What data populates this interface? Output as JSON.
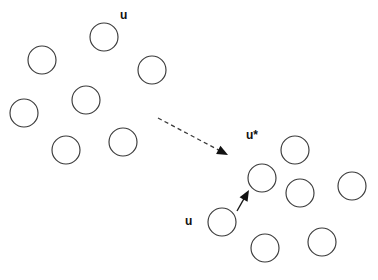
{
  "figure": {
    "width": 378,
    "height": 280,
    "background_color": "#ffffff",
    "circle_stroke_color": "#3a3a3a",
    "arrow_color": "#111111",
    "label_color": "#111111"
  },
  "labels": [
    {
      "id": "label-u-top",
      "text": "u",
      "x": 120,
      "y": 9
    },
    {
      "id": "label-u-star",
      "text": "u*",
      "x": 246,
      "y": 129
    },
    {
      "id": "label-u-bottom",
      "text": "u",
      "x": 185,
      "y": 215
    }
  ],
  "clusters": [
    {
      "name": "left-cluster",
      "circles": [
        {
          "id": "circle-left-1",
          "cx": 104,
          "cy": 37,
          "r": 14
        },
        {
          "id": "circle-left-2",
          "cx": 42,
          "cy": 60,
          "r": 14
        },
        {
          "id": "circle-left-3",
          "cx": 152,
          "cy": 70,
          "r": 14
        },
        {
          "id": "circle-left-4",
          "cx": 86,
          "cy": 100,
          "r": 14
        },
        {
          "id": "circle-left-5",
          "cx": 24,
          "cy": 113,
          "r": 14
        },
        {
          "id": "circle-left-6",
          "cx": 66,
          "cy": 150,
          "r": 14
        },
        {
          "id": "circle-left-7",
          "cx": 123,
          "cy": 142,
          "r": 14
        }
      ]
    },
    {
      "name": "right-cluster",
      "circles": [
        {
          "id": "circle-u-star",
          "cx": 262,
          "cy": 178,
          "r": 14
        },
        {
          "id": "circle-right-2",
          "cx": 295,
          "cy": 150,
          "r": 14
        },
        {
          "id": "circle-right-3",
          "cx": 300,
          "cy": 193,
          "r": 14
        },
        {
          "id": "circle-right-4",
          "cx": 352,
          "cy": 186,
          "r": 14
        },
        {
          "id": "circle-u-current",
          "cx": 222,
          "cy": 222,
          "r": 14
        },
        {
          "id": "circle-right-6",
          "cx": 265,
          "cy": 248,
          "r": 14
        },
        {
          "id": "circle-right-7",
          "cx": 322,
          "cy": 242,
          "r": 14
        }
      ]
    }
  ],
  "arrows": [
    {
      "id": "dashed-transition-arrow",
      "style": "dashed",
      "x1": 158,
      "y1": 118,
      "x2": 228,
      "y2": 155,
      "head_angle_deg": 27.8
    },
    {
      "id": "solid-update-arrow",
      "style": "solid",
      "x1": 237,
      "y1": 211,
      "x2": 249,
      "y2": 190,
      "head_angle_deg": -60.3
    }
  ]
}
